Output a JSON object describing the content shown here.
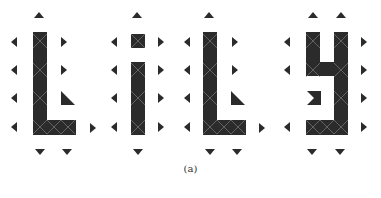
{
  "figure": {
    "caption": "(a)",
    "word": "LiLy",
    "colors": {
      "cell": "#2b2b2b",
      "cross_lines": "#8a8a8a",
      "arrow": "#2b2b2b",
      "background": "#ffffff"
    },
    "letters": [
      {
        "name": "L",
        "rects": [
          [
            33,
            32,
            14,
            103
          ],
          [
            33,
            120,
            43,
            15
          ]
        ],
        "crosses": [
          [
            33,
            34,
            14,
            14
          ],
          [
            33,
            63,
            14,
            14
          ],
          [
            33,
            91,
            14,
            14
          ],
          [
            33,
            120,
            14,
            14
          ],
          [
            47,
            120,
            14,
            14
          ],
          [
            61,
            120,
            14,
            14
          ]
        ],
        "triangles": [
          [
            "61,91 61,105 75,105"
          ]
        ],
        "arrows": [
          {
            "dir": "up",
            "x": 39,
            "y": 15
          },
          {
            "dir": "left",
            "x": 14,
            "y": 42
          },
          {
            "dir": "left",
            "x": 14,
            "y": 70
          },
          {
            "dir": "left",
            "x": 14,
            "y": 98
          },
          {
            "dir": "left",
            "x": 14,
            "y": 127
          },
          {
            "dir": "right",
            "x": 64,
            "y": 42
          },
          {
            "dir": "right",
            "x": 64,
            "y": 70
          },
          {
            "dir": "right",
            "x": 93,
            "y": 128
          },
          {
            "dir": "down",
            "x": 40,
            "y": 152
          },
          {
            "dir": "down",
            "x": 67,
            "y": 152
          }
        ]
      },
      {
        "name": "i",
        "rects": [
          [
            131,
            34,
            14,
            14
          ],
          [
            131,
            62,
            14,
            73
          ]
        ],
        "crosses": [
          [
            131,
            34,
            14,
            14
          ],
          [
            131,
            63,
            14,
            14
          ],
          [
            131,
            91,
            14,
            14
          ],
          [
            131,
            120,
            14,
            14
          ]
        ],
        "triangles": [],
        "arrows": [
          {
            "dir": "up",
            "x": 137,
            "y": 15
          },
          {
            "dir": "left",
            "x": 114,
            "y": 42
          },
          {
            "dir": "left",
            "x": 114,
            "y": 70
          },
          {
            "dir": "left",
            "x": 114,
            "y": 98
          },
          {
            "dir": "left",
            "x": 114,
            "y": 127
          },
          {
            "dir": "right",
            "x": 161,
            "y": 42
          },
          {
            "dir": "right",
            "x": 161,
            "y": 70
          },
          {
            "dir": "right",
            "x": 161,
            "y": 98
          },
          {
            "dir": "right",
            "x": 161,
            "y": 127
          },
          {
            "dir": "down",
            "x": 138,
            "y": 152
          }
        ]
      },
      {
        "name": "L",
        "rects": [
          [
            203,
            32,
            14,
            103
          ],
          [
            203,
            120,
            43,
            15
          ]
        ],
        "crosses": [
          [
            203,
            34,
            14,
            14
          ],
          [
            203,
            63,
            14,
            14
          ],
          [
            203,
            91,
            14,
            14
          ],
          [
            203,
            120,
            14,
            14
          ],
          [
            217,
            120,
            14,
            14
          ],
          [
            231,
            120,
            14,
            14
          ]
        ],
        "triangles": [
          [
            "231,91 231,105 245,105"
          ]
        ],
        "arrows": [
          {
            "dir": "up",
            "x": 209,
            "y": 15
          },
          {
            "dir": "left",
            "x": 187,
            "y": 42
          },
          {
            "dir": "left",
            "x": 187,
            "y": 70
          },
          {
            "dir": "left",
            "x": 187,
            "y": 98
          },
          {
            "dir": "left",
            "x": 187,
            "y": 127
          },
          {
            "dir": "right",
            "x": 235,
            "y": 42
          },
          {
            "dir": "right",
            "x": 235,
            "y": 70
          },
          {
            "dir": "right",
            "x": 262,
            "y": 128
          },
          {
            "dir": "down",
            "x": 210,
            "y": 152
          },
          {
            "dir": "down",
            "x": 237,
            "y": 152
          }
        ]
      },
      {
        "name": "y",
        "rects": [
          [
            306,
            32,
            14,
            44
          ],
          [
            334,
            32,
            14,
            103
          ],
          [
            306,
            62,
            42,
            14
          ],
          [
            306,
            120,
            42,
            15
          ]
        ],
        "crosses": [
          [
            306,
            34,
            14,
            14
          ],
          [
            334,
            34,
            14,
            14
          ],
          [
            306,
            63,
            14,
            14
          ],
          [
            334,
            63,
            14,
            14
          ],
          [
            334,
            91,
            14,
            14
          ],
          [
            306,
            120,
            14,
            14
          ],
          [
            320,
            120,
            14,
            14
          ],
          [
            334,
            120,
            14,
            14
          ]
        ],
        "triangles": [
          [
            "307,91 321,91 321,105 307,105 314,98"
          ]
        ],
        "arrows": [
          {
            "dir": "up",
            "x": 313,
            "y": 15
          },
          {
            "dir": "up",
            "x": 341,
            "y": 15
          },
          {
            "dir": "left",
            "x": 287,
            "y": 42
          },
          {
            "dir": "left",
            "x": 287,
            "y": 70
          },
          {
            "dir": "left",
            "x": 287,
            "y": 127
          },
          {
            "dir": "right",
            "x": 364,
            "y": 42
          },
          {
            "dir": "right",
            "x": 364,
            "y": 70
          },
          {
            "dir": "right",
            "x": 364,
            "y": 98
          },
          {
            "dir": "right",
            "x": 364,
            "y": 127
          },
          {
            "dir": "down",
            "x": 312,
            "y": 152
          },
          {
            "dir": "down",
            "x": 340,
            "y": 152
          }
        ]
      }
    ]
  }
}
